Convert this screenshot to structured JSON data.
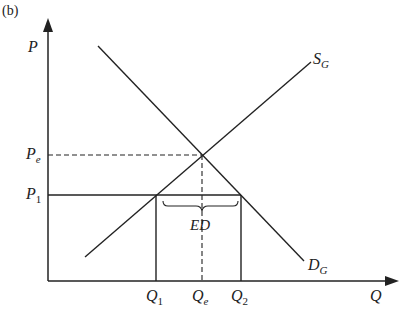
{
  "panel_label": "(b)",
  "axes": {
    "y_label": "P",
    "x_label": "Q"
  },
  "curves": {
    "supply": {
      "label": "S",
      "subscript": "G"
    },
    "demand": {
      "label": "D",
      "subscript": "G"
    }
  },
  "price_levels": [
    {
      "label": "P",
      "subscript": "e",
      "name": "equilibrium price"
    },
    {
      "label": "P",
      "subscript": "1",
      "name": "world price"
    }
  ],
  "quantity_levels": [
    {
      "label": "Q",
      "subscript": "1"
    },
    {
      "label": "Q",
      "subscript": "e"
    },
    {
      "label": "Q",
      "subscript": "2"
    }
  ],
  "annotation": "ED",
  "colors": {
    "line": "#222222",
    "background": "#ffffff"
  }
}
